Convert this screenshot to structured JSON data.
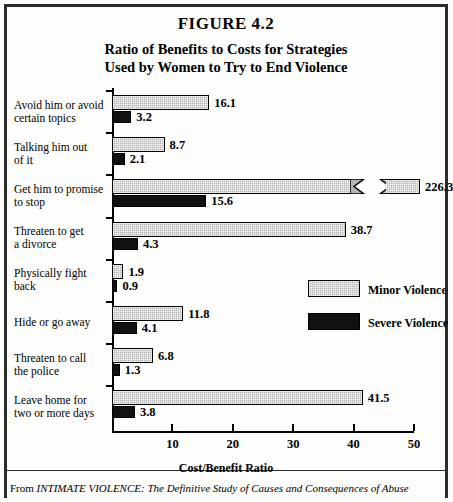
{
  "figure": {
    "number": "FIGURE 4.2",
    "title_line1": "Ratio of Benefits to Costs for Strategies",
    "title_line2": "Used by Women to Try to End Violence",
    "source_prefix": "From ",
    "source_italic": "INTIMATE VIOLENCE: The Definitive Study of Causes and Consequences of Abuse"
  },
  "legend": {
    "minor_label": "Minor Violence",
    "severe_label": "Severe Violence",
    "minor_color": "#b4b4b4",
    "severe_color": "#111111"
  },
  "chart_data": {
    "type": "bar",
    "orientation": "horizontal",
    "title": "Ratio of Benefits to Costs for Strategies Used by Women to Try to End Violence",
    "xlabel": "Cost/Benefit Ratio",
    "ylabel": "",
    "xlim": [
      0,
      50
    ],
    "xticks": [
      10,
      20,
      30,
      40,
      50
    ],
    "xtick_labels": [
      "10",
      "20",
      "30",
      "40",
      "50"
    ],
    "grid": false,
    "legend_position": "middle-right",
    "axis_break_note": "Minor Violence bar for 'Get him to promise to stop' (226.3) exceeds the axis and is drawn with a zigzag break",
    "categories": [
      "Avoid him or avoid certain topics",
      "Talking him out of it",
      "Get him to promise to stop",
      "Threaten to get a divorce",
      "Physically fight back",
      "Hide or go away",
      "Threaten to call the police",
      "Leave home for two or more days"
    ],
    "category_lines": [
      [
        "Avoid him or avoid",
        "certain topics"
      ],
      [
        "Talking him out",
        "of it"
      ],
      [
        "Get him to promise",
        "to stop"
      ],
      [
        "Threaten to get",
        "a divorce"
      ],
      [
        "Physically fight",
        "back"
      ],
      [
        "Hide or go away"
      ],
      [
        "Threaten to call",
        "the police"
      ],
      [
        "Leave home for",
        "two or more days"
      ]
    ],
    "series": [
      {
        "name": "Minor Violence",
        "values": [
          16.1,
          8.7,
          226.3,
          38.7,
          1.9,
          11.8,
          6.8,
          41.5
        ],
        "value_labels": [
          "16.1",
          "8.7",
          "226.3",
          "38.7",
          "1.9",
          "11.8",
          "6.8",
          "41.5"
        ]
      },
      {
        "name": "Severe Violence",
        "values": [
          3.2,
          2.1,
          15.6,
          4.3,
          0.9,
          4.1,
          1.3,
          3.8
        ],
        "value_labels": [
          "3.2",
          "2.1",
          "15.6",
          "4.3",
          "0.9",
          "4.1",
          "1.3",
          "3.8"
        ]
      }
    ]
  }
}
